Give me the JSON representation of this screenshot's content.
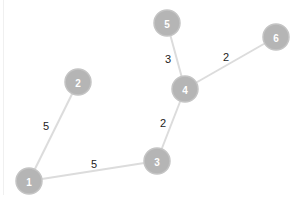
{
  "graph": {
    "node_color": "#b5b5b5",
    "edge_color": "#dcdcdc",
    "label_color": "#ffffff",
    "weight_color": "#222222",
    "nodes": [
      {
        "id": "1",
        "label": "1",
        "x": 29,
        "y": 181
      },
      {
        "id": "2",
        "label": "2",
        "x": 78,
        "y": 82
      },
      {
        "id": "3",
        "label": "3",
        "x": 157,
        "y": 161
      },
      {
        "id": "4",
        "label": "4",
        "x": 185,
        "y": 89
      },
      {
        "id": "5",
        "label": "5",
        "x": 167,
        "y": 23
      },
      {
        "id": "6",
        "label": "6",
        "x": 276,
        "y": 37
      }
    ],
    "edges": [
      {
        "source": "1",
        "target": "2",
        "weight": "5",
        "lx": 46,
        "ly": 126
      },
      {
        "source": "1",
        "target": "3",
        "weight": "5",
        "lx": 94,
        "ly": 164
      },
      {
        "source": "3",
        "target": "4",
        "weight": "2",
        "lx": 163,
        "ly": 123
      },
      {
        "source": "4",
        "target": "5",
        "weight": "3",
        "lx": 168,
        "ly": 59
      },
      {
        "source": "4",
        "target": "6",
        "weight": "2",
        "lx": 226,
        "ly": 57
      }
    ]
  }
}
